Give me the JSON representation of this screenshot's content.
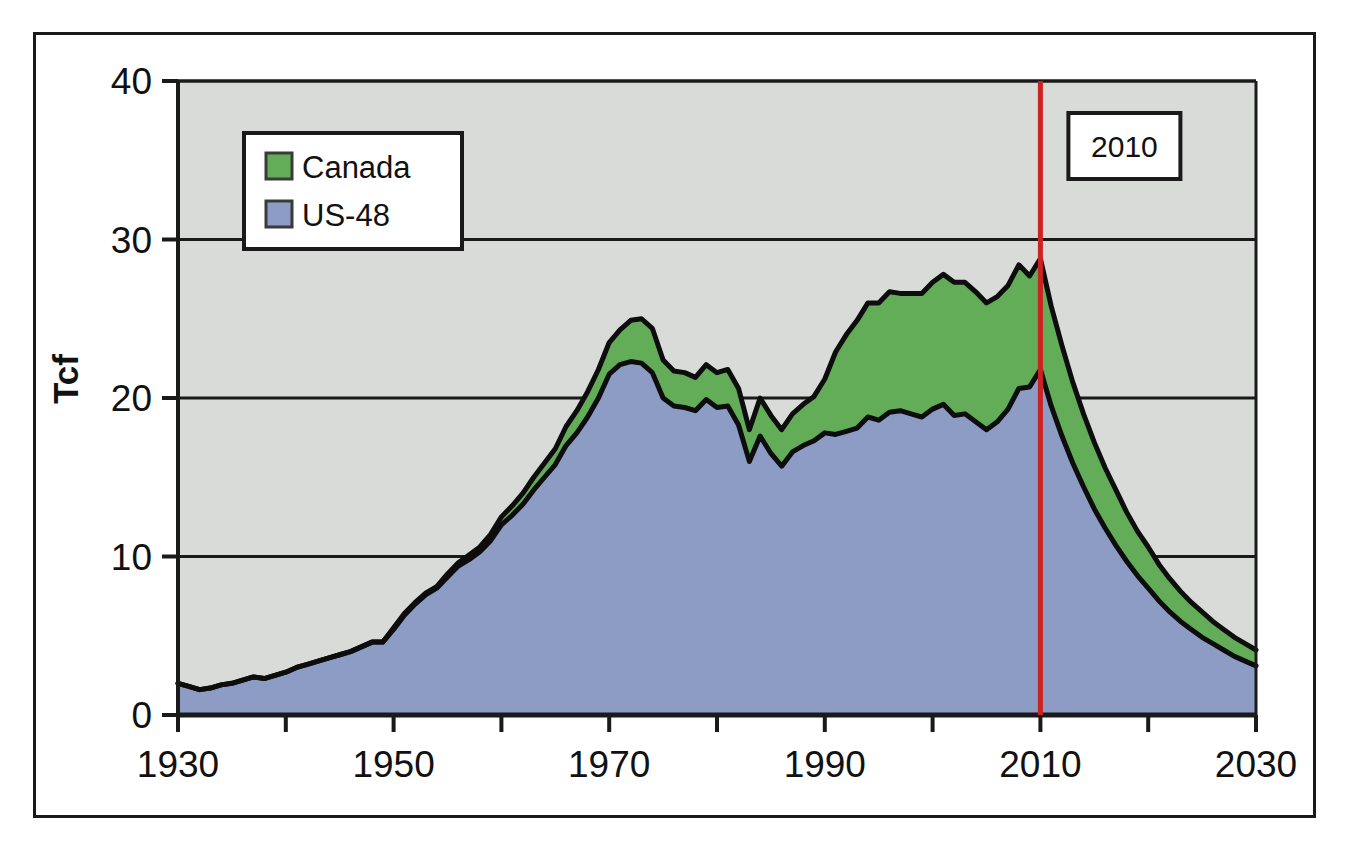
{
  "figure": {
    "ylabel": "Tcf",
    "annotation_label": "2010",
    "marker_line_color": "#cc2222",
    "frame_color": "#1a1a1a",
    "plot_background": "#d9dbd9"
  },
  "legend": {
    "position": "top-left-inside",
    "entries": [
      {
        "label": "Canada",
        "color": "#63ad58"
      },
      {
        "label": "US-48",
        "color": "#8d9cc4"
      }
    ]
  },
  "chart_data": {
    "type": "area",
    "title": "",
    "subtitle": "",
    "xlabel": "",
    "ylabel": "Tcf",
    "xlim": [
      1930,
      2030
    ],
    "ylim": [
      0,
      40
    ],
    "xticks": [
      1930,
      1940,
      1950,
      1960,
      1970,
      1980,
      1990,
      2000,
      2010,
      2020,
      2030
    ],
    "xtick_labels_shown": [
      "1930",
      "1950",
      "1970",
      "1990",
      "2010",
      "2030"
    ],
    "yticks": [
      0,
      10,
      20,
      30,
      40
    ],
    "ytick_labels": [
      "0",
      "10",
      "20",
      "30",
      "40"
    ],
    "grid": "horizontal",
    "legend_position": "upper left",
    "stacked": true,
    "annotations": [
      {
        "text": "2010",
        "x": 2010,
        "type": "vertical-line-label",
        "color": "#cc2222"
      }
    ],
    "x": [
      1930,
      1931,
      1932,
      1933,
      1934,
      1935,
      1936,
      1937,
      1938,
      1939,
      1940,
      1941,
      1942,
      1943,
      1944,
      1945,
      1946,
      1947,
      1948,
      1949,
      1950,
      1951,
      1952,
      1953,
      1954,
      1955,
      1956,
      1957,
      1958,
      1959,
      1960,
      1961,
      1962,
      1963,
      1964,
      1965,
      1966,
      1967,
      1968,
      1969,
      1970,
      1971,
      1972,
      1973,
      1974,
      1975,
      1976,
      1977,
      1978,
      1979,
      1980,
      1981,
      1982,
      1983,
      1984,
      1985,
      1986,
      1987,
      1988,
      1989,
      1990,
      1991,
      1992,
      1993,
      1994,
      1995,
      1996,
      1997,
      1998,
      1999,
      2000,
      2001,
      2002,
      2003,
      2004,
      2005,
      2006,
      2007,
      2008,
      2009,
      2010,
      2011,
      2012,
      2013,
      2014,
      2015,
      2016,
      2017,
      2018,
      2019,
      2020,
      2021,
      2022,
      2023,
      2024,
      2025,
      2026,
      2027,
      2028,
      2029,
      2030
    ],
    "series": [
      {
        "name": "US-48",
        "color": "#8d9cc4",
        "values": [
          2.0,
          1.8,
          1.6,
          1.7,
          1.9,
          2.0,
          2.2,
          2.4,
          2.3,
          2.5,
          2.7,
          3.0,
          3.2,
          3.4,
          3.6,
          3.8,
          4.0,
          4.3,
          4.6,
          4.6,
          5.4,
          6.3,
          7.0,
          7.6,
          8.0,
          8.7,
          9.4,
          9.8,
          10.3,
          11.0,
          12.0,
          12.6,
          13.3,
          14.2,
          15.0,
          15.8,
          17.0,
          17.8,
          18.8,
          20.0,
          21.5,
          22.1,
          22.3,
          22.2,
          21.6,
          20.0,
          19.5,
          19.4,
          19.2,
          19.9,
          19.4,
          19.5,
          18.3,
          16.0,
          17.6,
          16.5,
          15.7,
          16.6,
          17.0,
          17.3,
          17.8,
          17.7,
          17.9,
          18.1,
          18.8,
          18.6,
          19.1,
          19.2,
          19.0,
          18.8,
          19.3,
          19.6,
          18.9,
          19.0,
          18.5,
          18.0,
          18.5,
          19.3,
          20.6,
          20.7,
          21.8,
          19.5,
          17.6,
          15.9,
          14.4,
          13.0,
          11.8,
          10.7,
          9.7,
          8.8,
          8.0,
          7.2,
          6.5,
          5.9,
          5.4,
          4.9,
          4.5,
          4.1,
          3.7,
          3.4,
          3.1
        ]
      },
      {
        "name": "Canada",
        "color": "#63ad58",
        "values": [
          0.0,
          0.0,
          0.0,
          0.0,
          0.0,
          0.0,
          0.0,
          0.0,
          0.0,
          0.0,
          0.0,
          0.0,
          0.0,
          0.0,
          0.0,
          0.0,
          0.0,
          0.0,
          0.0,
          0.0,
          0.1,
          0.1,
          0.1,
          0.1,
          0.1,
          0.2,
          0.2,
          0.3,
          0.3,
          0.4,
          0.5,
          0.6,
          0.7,
          0.8,
          0.9,
          1.0,
          1.2,
          1.4,
          1.6,
          1.8,
          2.0,
          2.2,
          2.6,
          2.8,
          2.8,
          2.4,
          2.2,
          2.2,
          2.1,
          2.2,
          2.2,
          2.3,
          2.3,
          2.0,
          2.4,
          2.4,
          2.3,
          2.4,
          2.6,
          2.8,
          3.4,
          5.2,
          6.1,
          6.8,
          7.2,
          7.4,
          7.6,
          7.4,
          7.6,
          7.8,
          8.0,
          8.2,
          8.4,
          8.3,
          8.2,
          8.0,
          7.9,
          7.8,
          7.8,
          7.0,
          7.0,
          6.3,
          5.7,
          5.1,
          4.6,
          4.2,
          3.8,
          3.5,
          3.1,
          2.8,
          2.6,
          2.3,
          2.1,
          1.9,
          1.7,
          1.6,
          1.4,
          1.3,
          1.2,
          1.1,
          1.0
        ]
      }
    ]
  }
}
